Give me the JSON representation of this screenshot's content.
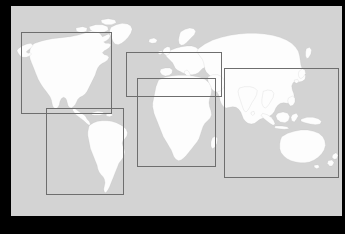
{
  "app": {
    "title": "World Map Region Selector",
    "view_type": "world-map",
    "projection": "equirectangular"
  },
  "frame": {
    "border_color": "#000000",
    "top_px": 6,
    "left_px": 11,
    "right_px": 3,
    "bottom_px": 18
  },
  "map": {
    "background_color": "#d3d3d3",
    "land_fill_color": "#fdfdfd",
    "land_stroke_color": "#b0b0b0",
    "label": "World map, white landmasses on gray ocean"
  },
  "regions": {
    "box_stroke_color": "#6e6e6e",
    "count": 5,
    "items": [
      {
        "name": "north-america",
        "label": "North America",
        "left_pct": 3.0,
        "top_pct": 12.3,
        "width_pct": 27.5,
        "height_pct": 39.0
      },
      {
        "name": "south-america",
        "label": "South America",
        "left_pct": 10.5,
        "top_pct": 48.5,
        "width_pct": 23.5,
        "height_pct": 41.5
      },
      {
        "name": "europe-mediterranean",
        "label": "Europe & Mediterranean",
        "left_pct": 34.8,
        "top_pct": 22.0,
        "width_pct": 29.0,
        "height_pct": 21.5
      },
      {
        "name": "africa",
        "label": "Africa",
        "left_pct": 38.0,
        "top_pct": 34.5,
        "width_pct": 24.0,
        "height_pct": 42.0
      },
      {
        "name": "asia-pacific",
        "label": "Asia Pacific",
        "left_pct": 64.5,
        "top_pct": 29.5,
        "width_pct": 34.5,
        "height_pct": 52.5
      }
    ]
  }
}
